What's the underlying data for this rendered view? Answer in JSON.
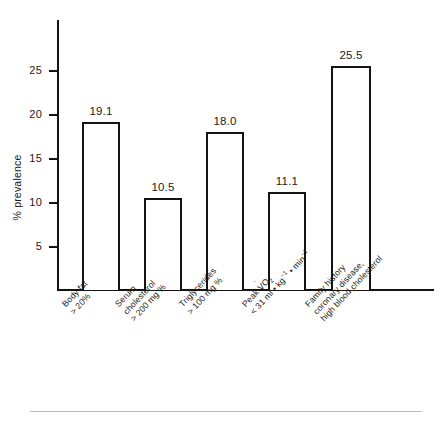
{
  "chart_data": {
    "type": "bar",
    "title": "",
    "subtitle": "",
    "xlabel": "",
    "ylabel": "% prevalence",
    "ylim": [
      0,
      28.5
    ],
    "yticks": [
      5,
      10,
      15,
      20,
      25
    ],
    "grid": false,
    "legend": null,
    "categories": [
      "Body fat > 20%",
      "Serum cholesterol > 200 mg %",
      "Triglycerides > 100 mg %",
      "Peak VO2 < 31 ml • kg-1 • min-1",
      "Family history coronary disease, high blood cholesterol"
    ],
    "values": [
      19.1,
      10.5,
      18.0,
      11.1,
      25.5
    ],
    "value_labels": [
      "19.1",
      "10.5",
      "18.0",
      "11.1",
      "25.5"
    ],
    "bar_style": {
      "fill": "#ffffff",
      "edge": "#141414",
      "edge_width": 2
    }
  },
  "axes": {
    "y_title": "% prevalence",
    "y_tick_labels": [
      "25",
      "20",
      "15",
      "10",
      "5"
    ],
    "axis_color": "#141414"
  },
  "categories": [
    {
      "id": "body-fat",
      "lines": [
        "Body fat",
        "> 20%"
      ],
      "value": "19.1"
    },
    {
      "id": "serum-cholesterol",
      "lines": [
        "Serum",
        "cholesterol",
        "> 200 mg %"
      ],
      "value": "10.5"
    },
    {
      "id": "triglycerides",
      "lines": [
        "Triglycerides",
        "> 100 mg %"
      ],
      "value": "18.0"
    },
    {
      "id": "peak-vo2",
      "lines": [
        "Peak VO2",
        "< 31 ml • kg-1 • min-1"
      ],
      "value": "11.1"
    },
    {
      "id": "family-history",
      "lines": [
        "Family history",
        "coronary disease,",
        "high blood cholesterol"
      ],
      "value": "25.5"
    }
  ]
}
